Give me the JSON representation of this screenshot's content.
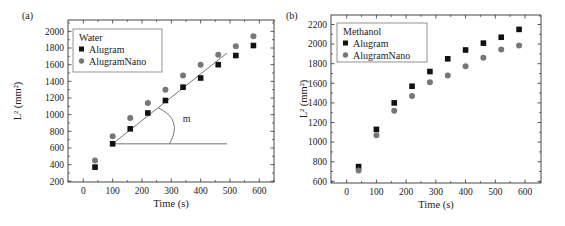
{
  "figure": {
    "panels": [
      "(a)",
      "(b)"
    ]
  },
  "chart_data": [
    {
      "type": "scatter",
      "panel": "(a)",
      "title": "",
      "legend_title": "Water",
      "xlabel": "Time (s)",
      "ylabel": "L² (mm²)",
      "xlim": [
        -50,
        650
      ],
      "ylim": [
        200,
        2100
      ],
      "xticks": [
        0,
        100,
        200,
        300,
        400,
        500,
        600
      ],
      "yticks": [
        200,
        400,
        600,
        800,
        1000,
        1200,
        1400,
        1600,
        1800,
        2000
      ],
      "grid": false,
      "legend_position": "upper left",
      "x": [
        40,
        100,
        160,
        220,
        280,
        340,
        400,
        460,
        520,
        580
      ],
      "series": [
        {
          "name": "Alugram",
          "marker": "square",
          "color": "#111111",
          "values": [
            370,
            650,
            830,
            1020,
            1170,
            1330,
            1440,
            1600,
            1710,
            1830
          ]
        },
        {
          "name": "AlugramNano",
          "marker": "circle",
          "color": "#777777",
          "values": [
            450,
            740,
            960,
            1140,
            1300,
            1470,
            1600,
            1720,
            1820,
            1940
          ]
        }
      ],
      "annotations": [
        {
          "type": "fit-line",
          "from": [
            100,
            650
          ],
          "to": [
            490,
            1740
          ]
        },
        {
          "type": "horizontal-line",
          "from": [
            100,
            650
          ],
          "to": [
            490,
            650
          ]
        },
        {
          "type": "angle-arc",
          "label": "m"
        }
      ]
    },
    {
      "type": "scatter",
      "panel": "(b)",
      "title": "",
      "legend_title": "Methanol",
      "xlabel": "Time (s)",
      "ylabel": "L² (mm²)",
      "xlim": [
        -50,
        650
      ],
      "ylim": [
        600,
        2300
      ],
      "xticks": [
        0,
        100,
        200,
        300,
        400,
        500,
        600
      ],
      "yticks": [
        600,
        800,
        1000,
        1200,
        1400,
        1600,
        1800,
        2000,
        2200
      ],
      "grid": false,
      "legend_position": "upper left",
      "x": [
        40,
        100,
        160,
        220,
        280,
        340,
        400,
        460,
        520,
        580
      ],
      "series": [
        {
          "name": "Alugram",
          "marker": "square",
          "color": "#111111",
          "values": [
            750,
            1130,
            1400,
            1570,
            1720,
            1850,
            1940,
            2010,
            2070,
            2150
          ]
        },
        {
          "name": "AlugramNano",
          "marker": "circle",
          "color": "#777777",
          "values": [
            710,
            1070,
            1320,
            1470,
            1610,
            1680,
            1775,
            1860,
            1945,
            1985
          ]
        }
      ]
    }
  ]
}
